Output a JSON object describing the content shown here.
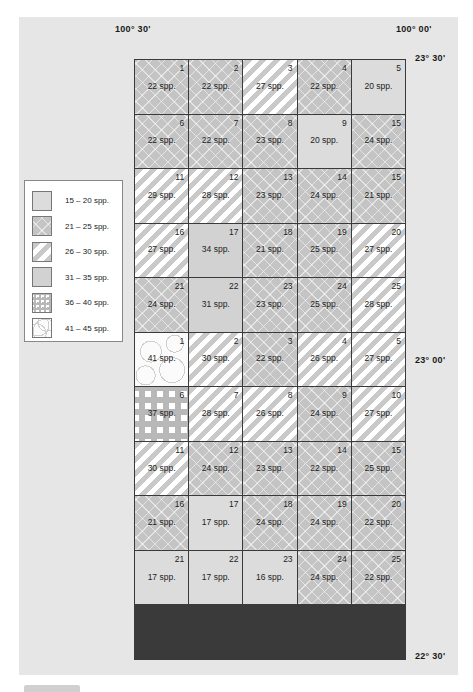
{
  "coordinates": {
    "lon_left": "100° 30'",
    "lon_right": "100° 00'",
    "lat_top": "23° 30'",
    "lat_mid": "23° 00'",
    "lat_bottom": "22° 30'"
  },
  "legend": {
    "items": [
      {
        "label": "15 – 20 spp.",
        "pattern": "p15"
      },
      {
        "label": "21 – 25 spp.",
        "pattern": "p21"
      },
      {
        "label": "26 – 30 spp.",
        "pattern": "p26"
      },
      {
        "label": "31 – 35 spp.",
        "pattern": "p31"
      },
      {
        "label": "36 – 40 spp.",
        "pattern": "p36"
      },
      {
        "label": "41 – 45 spp.",
        "pattern": "p41"
      }
    ]
  },
  "grid": {
    "cells": [
      {
        "num": "1",
        "value": "22 spp.",
        "pattern": "p21"
      },
      {
        "num": "2",
        "value": "22 spp.",
        "pattern": "p21"
      },
      {
        "num": "3",
        "value": "27 spp.",
        "pattern": "p26"
      },
      {
        "num": "4",
        "value": "22 spp.",
        "pattern": "p21"
      },
      {
        "num": "5",
        "value": "20 spp.",
        "pattern": "p15"
      },
      {
        "num": "6",
        "value": "22 spp.",
        "pattern": "p21"
      },
      {
        "num": "7",
        "value": "22 spp.",
        "pattern": "p21"
      },
      {
        "num": "8",
        "value": "23 spp.",
        "pattern": "p21"
      },
      {
        "num": "9",
        "value": "20 spp.",
        "pattern": "p15"
      },
      {
        "num": "15",
        "value": "24 spp.",
        "pattern": "p21"
      },
      {
        "num": "11",
        "value": "29 spp.",
        "pattern": "p26"
      },
      {
        "num": "12",
        "value": "28 spp.",
        "pattern": "p26"
      },
      {
        "num": "13",
        "value": "23 spp.",
        "pattern": "p21"
      },
      {
        "num": "14",
        "value": "24 spp.",
        "pattern": "p21"
      },
      {
        "num": "15",
        "value": "21 spp.",
        "pattern": "p21"
      },
      {
        "num": "16",
        "value": "27 spp.",
        "pattern": "p26"
      },
      {
        "num": "17",
        "value": "34 spp.",
        "pattern": "p31"
      },
      {
        "num": "18",
        "value": "21 spp.",
        "pattern": "p21"
      },
      {
        "num": "19",
        "value": "25 spp.",
        "pattern": "p21"
      },
      {
        "num": "20",
        "value": "27 spp.",
        "pattern": "p26"
      },
      {
        "num": "21",
        "value": "24 spp.",
        "pattern": "p21"
      },
      {
        "num": "22",
        "value": "31 spp.",
        "pattern": "p31"
      },
      {
        "num": "23",
        "value": "23 spp.",
        "pattern": "p21"
      },
      {
        "num": "24",
        "value": "25 spp.",
        "pattern": "p21"
      },
      {
        "num": "25",
        "value": "28 spp.",
        "pattern": "p26"
      },
      {
        "num": "1",
        "value": "41 spp.",
        "pattern": "p41"
      },
      {
        "num": "2",
        "value": "30 spp.",
        "pattern": "p26"
      },
      {
        "num": "3",
        "value": "22 spp.",
        "pattern": "p21"
      },
      {
        "num": "4",
        "value": "26 spp.",
        "pattern": "p26"
      },
      {
        "num": "5",
        "value": "27 spp.",
        "pattern": "p26"
      },
      {
        "num": "6",
        "value": "37 spp.",
        "pattern": "p36"
      },
      {
        "num": "7",
        "value": "28 spp.",
        "pattern": "p26"
      },
      {
        "num": "8",
        "value": "26 spp.",
        "pattern": "p26"
      },
      {
        "num": "9",
        "value": "24 spp.",
        "pattern": "p21"
      },
      {
        "num": "10",
        "value": "27 spp.",
        "pattern": "p26"
      },
      {
        "num": "11",
        "value": "30 spp.",
        "pattern": "p26"
      },
      {
        "num": "12",
        "value": "24 spp.",
        "pattern": "p21"
      },
      {
        "num": "13",
        "value": "23 spp.",
        "pattern": "p21"
      },
      {
        "num": "14",
        "value": "22 spp.",
        "pattern": "p21"
      },
      {
        "num": "15",
        "value": "25 spp.",
        "pattern": "p21"
      },
      {
        "num": "16",
        "value": "21 spp.",
        "pattern": "p21"
      },
      {
        "num": "17",
        "value": "17 spp.",
        "pattern": "p15"
      },
      {
        "num": "18",
        "value": "24 spp.",
        "pattern": "p21"
      },
      {
        "num": "19",
        "value": "24 spp.",
        "pattern": "p21"
      },
      {
        "num": "20",
        "value": "22 spp.",
        "pattern": "p21"
      },
      {
        "num": "21",
        "value": "17 spp.",
        "pattern": "p15"
      },
      {
        "num": "22",
        "value": "17 spp.",
        "pattern": "p15"
      },
      {
        "num": "23",
        "value": "16 spp.",
        "pattern": "p15"
      },
      {
        "num": "24",
        "value": "24 spp.",
        "pattern": "p21"
      },
      {
        "num": "25",
        "value": "22 spp.",
        "pattern": "p21"
      }
    ]
  }
}
